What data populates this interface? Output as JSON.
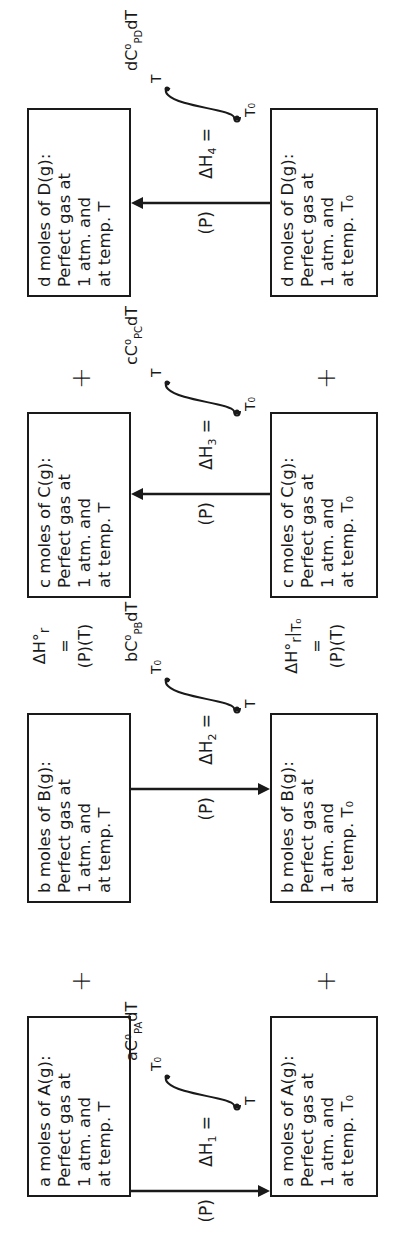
{
  "orientation": "rotated -90deg (text reads bottom-to-top)",
  "columns": [
    {
      "species": "A",
      "top_box": [
        "a moles of A(g):",
        "Perfect gas at",
        "1 atm. and",
        "at temp. T"
      ],
      "bottom_box": [
        "a moles of A(g):",
        "Perfect gas at",
        "1 atm. and",
        "at temp. T₀"
      ],
      "arrow_direction": "down",
      "path_label": "(P)",
      "enthalpy": {
        "delta": "ΔH",
        "index": "1",
        "equals": "="
      },
      "integral": {
        "lower": "T",
        "upper": "T₀",
        "coef": "a",
        "cp": "C",
        "sup": "o",
        "sub": "PA",
        "dT": "dT"
      }
    },
    {
      "species": "B",
      "top_box": [
        "b moles of B(g):",
        "Perfect gas at",
        "1 atm. and",
        "at temp. T"
      ],
      "bottom_box": [
        "b moles of B(g):",
        "Perfect gas at",
        "1 atm. and",
        "at temp. T₀"
      ],
      "arrow_direction": "down",
      "path_label": "(P)",
      "enthalpy": {
        "delta": "ΔH",
        "index": "2",
        "equals": "="
      },
      "integral": {
        "lower": "T",
        "upper": "T₀",
        "coef": "b",
        "cp": "C",
        "sup": "o",
        "sub": "PB",
        "dT": "dT"
      }
    },
    {
      "species": "C",
      "top_box": [
        "c moles of C(g):",
        "Perfect gas at",
        "1 atm. and",
        "at temp. T"
      ],
      "bottom_box": [
        "c moles of C(g):",
        "Perfect gas at",
        "1 atm. and",
        "at temp. T₀"
      ],
      "arrow_direction": "up",
      "path_label": "(P)",
      "enthalpy": {
        "delta": "ΔH",
        "index": "3",
        "equals": "="
      },
      "integral": {
        "lower": "T₀",
        "upper": "T",
        "coef": "c",
        "cp": "C",
        "sup": "o",
        "sub": "PC",
        "dT": "dT"
      }
    },
    {
      "species": "D",
      "top_box": [
        "d moles of D(g):",
        "Perfect gas at",
        "1 atm. and",
        "at temp. T"
      ],
      "bottom_box": [
        "d moles of D(g):",
        "Perfect gas at",
        "1 atm. and",
        "at temp. T₀"
      ],
      "arrow_direction": "up",
      "path_label": "(P)",
      "enthalpy": {
        "delta": "ΔH",
        "index": "4",
        "equals": "="
      },
      "integral": {
        "lower": "T₀",
        "upper": "T",
        "coef": "d",
        "cp": "C",
        "sup": "o",
        "sub": "PD",
        "dT": "dT"
      }
    }
  ],
  "plus_sign": "+",
  "reaction_enthalpy_top": {
    "line1": "ΔH°",
    "sub": "r",
    "line2": "=",
    "line3": "(P)(T)"
  },
  "reaction_enthalpy_bottom": {
    "line1": "ΔH°",
    "sub": "r",
    "bar": "|",
    "barsub": "T₀",
    "line2": "=",
    "line3": "(P)(T)"
  },
  "colors": {
    "ink": "#1a1a1a",
    "background": "#ffffff"
  }
}
